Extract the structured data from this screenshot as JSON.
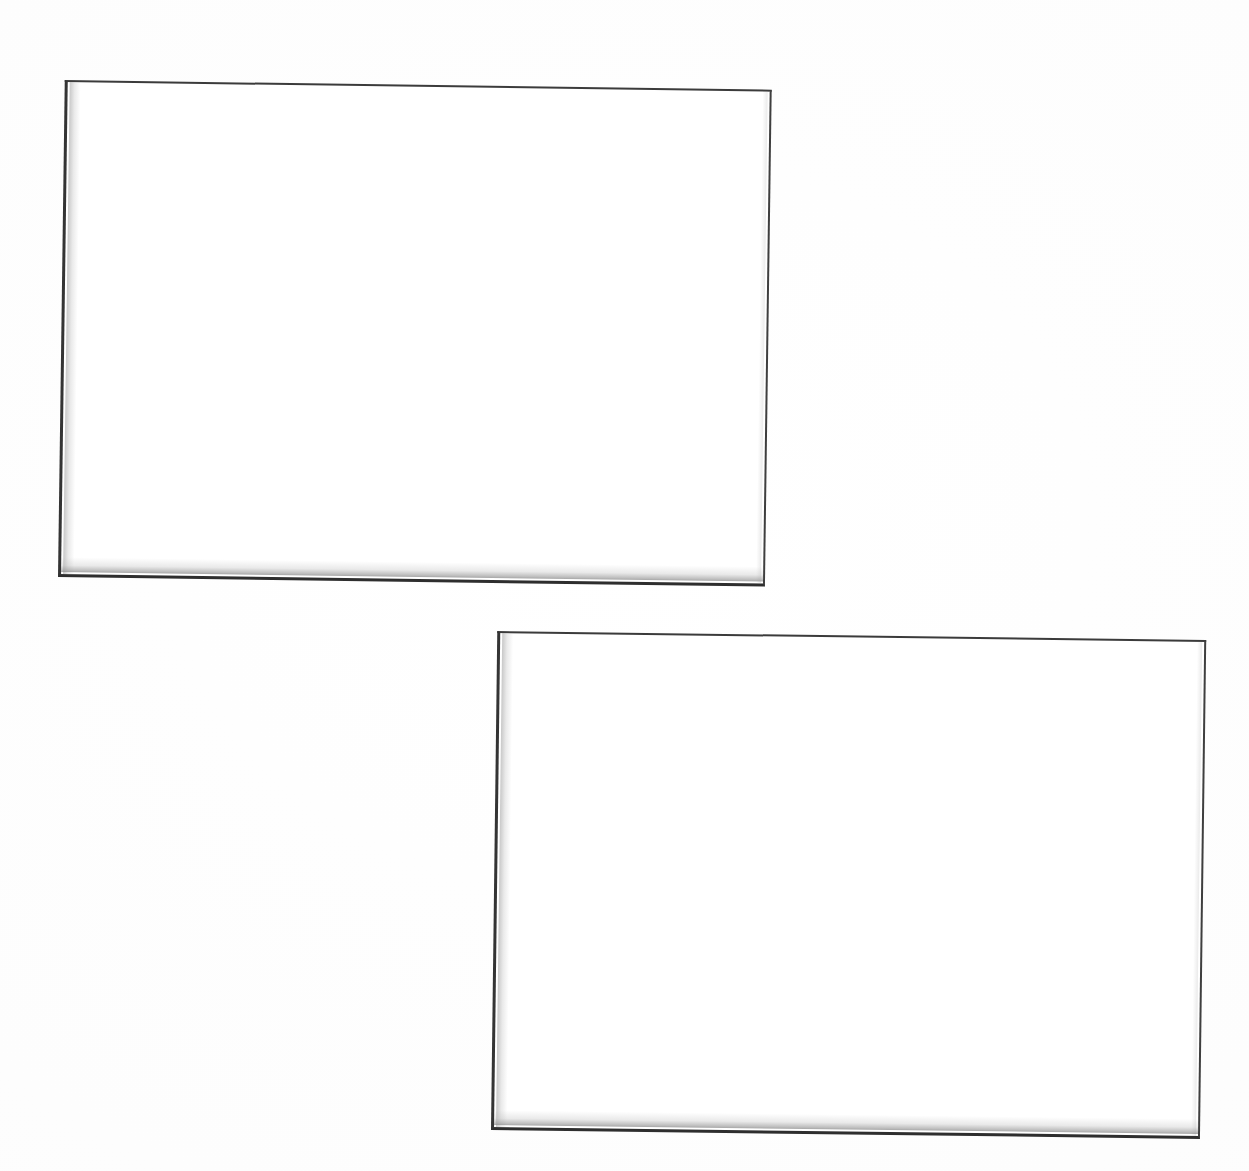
{
  "page": {
    "background_color": "#ffffff",
    "width": 1249,
    "height": 1171,
    "visible_text": "",
    "note": "Blank scanned page containing two empty rectangular figure frames; no text, labels, captions or numbers are rendered anywhere in the image."
  },
  "figures": [
    {
      "id": "frame-top-left",
      "name": "blank-figure-frame-upper-left",
      "caption": "",
      "content_text": "",
      "border_color": "#3b3b3b",
      "fill_color": "#ffffff",
      "shadow_color": "#9a9a9a",
      "geometry": {
        "left": 58,
        "top": 80,
        "width": 707,
        "height": 497,
        "rotation_deg": 0.78,
        "corners": {
          "top_left": [
            67,
            82
          ],
          "top_right": [
            766,
            92
          ],
          "bottom_right": [
            760,
            582
          ],
          "bottom_left": [
            58,
            574
          ]
        }
      }
    },
    {
      "id": "frame-bottom-right",
      "name": "blank-figure-frame-lower-right",
      "caption": "",
      "content_text": "",
      "border_color": "#3b3b3b",
      "fill_color": "#ffffff",
      "shadow_color": "#9a9a9a",
      "geometry": {
        "left": 491,
        "top": 631,
        "width": 709,
        "height": 499,
        "rotation_deg": 0.72,
        "corners": {
          "top_left": [
            497,
            633
          ],
          "top_right": [
            1200,
            645
          ],
          "bottom_right": [
            1197,
            1133
          ],
          "bottom_left": [
            493,
            1128
          ]
        }
      }
    }
  ]
}
